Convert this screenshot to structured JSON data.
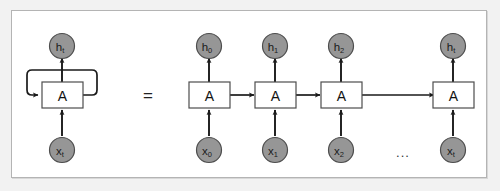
{
  "figure": {
    "colors": {
      "page_background": "#f2f2f2",
      "panel_background": "#ffffff",
      "panel_border": "#b4b4b4",
      "node_fill": "#969696",
      "node_stroke": "#4d4d4d",
      "cell_fill": "#ffffff",
      "cell_stroke": "#4d4d4d",
      "arrow_stroke": "#1a1a1a",
      "text": "#1a1a1a"
    },
    "equals_sign": "=",
    "ellipsis": "...",
    "folded": {
      "cell_label": "A",
      "output_base": "h",
      "output_sub": "t",
      "input_base": "x",
      "input_sub": "t",
      "loop_name": "recurrent-self-loop"
    },
    "unrolled": {
      "steps": [
        {
          "cell_label": "A",
          "output_base": "h",
          "output_sub": "0",
          "input_base": "x",
          "input_sub": "0"
        },
        {
          "cell_label": "A",
          "output_base": "h",
          "output_sub": "1",
          "input_base": "x",
          "input_sub": "1"
        },
        {
          "cell_label": "A",
          "output_base": "h",
          "output_sub": "2",
          "input_base": "x",
          "input_sub": "2"
        },
        {
          "cell_label": "A",
          "output_base": "h",
          "output_sub": "t",
          "input_base": "x",
          "input_sub": "t"
        }
      ]
    }
  }
}
